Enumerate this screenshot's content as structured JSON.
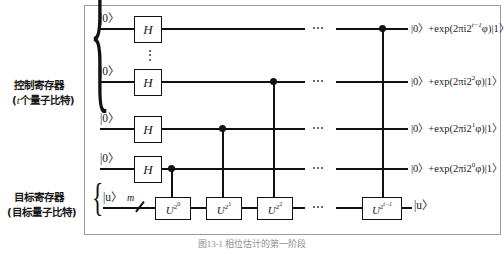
{
  "figure": {
    "caption": "图13-1  相位估计的第一阶段"
  },
  "registers": {
    "control": {
      "name": "控制寄存器",
      "sub_prefix": "(",
      "sub_var": "t",
      "sub_rest": "个量子比特)"
    },
    "target": {
      "name": "目标寄存器",
      "sub": "(目标量子比特)",
      "wire_label": "m"
    }
  },
  "gates": {
    "hadamard_label": "H",
    "u_base": "U",
    "u_exponents": [
      "2⁰",
      "2¹",
      "2²",
      "2^{t-1}"
    ]
  },
  "kets": {
    "zero": "|0〉",
    "u": "|u〉"
  },
  "ellipsis": {
    "horizontal": "⋯",
    "vertical": "⋮"
  },
  "rows": [
    {
      "id": "control-row-top",
      "input": "|0〉",
      "gate": "H",
      "output_prefix": "|0〉+exp(2πi2",
      "output_exp": "t−1",
      "output_suffix": "φ)|1〉"
    },
    {
      "id": "control-row-2",
      "input": "|0〉",
      "gate": "H",
      "output_prefix": "|0〉+exp(2πi2",
      "output_exp": "2",
      "output_suffix": "φ)|1〉"
    },
    {
      "id": "control-row-3",
      "input": "|0〉",
      "gate": "H",
      "output_prefix": "|0〉+exp(2πi2",
      "output_exp": "1",
      "output_suffix": "φ)|1〉"
    },
    {
      "id": "control-row-4",
      "input": "|0〉",
      "gate": "H",
      "output_prefix": "|0〉+exp(2πi2",
      "output_exp": "0",
      "output_suffix": "φ)|1〉"
    },
    {
      "id": "target-row",
      "input": "|u〉",
      "gate": "",
      "output": "|u〉"
    }
  ],
  "u_gates": [
    {
      "id": "u-gate-1",
      "base": "U",
      "exp_base": "2",
      "exp_exp": "0"
    },
    {
      "id": "u-gate-2",
      "base": "U",
      "exp_base": "2",
      "exp_exp": "1"
    },
    {
      "id": "u-gate-3",
      "base": "U",
      "exp_base": "2",
      "exp_exp": "2"
    },
    {
      "id": "u-gate-last",
      "base": "U",
      "exp_base": "2",
      "exp_exp": "t−1"
    }
  ],
  "colors": {
    "ink": "#111111",
    "frame": "#9a9a9a",
    "paper": "#ffffff"
  }
}
